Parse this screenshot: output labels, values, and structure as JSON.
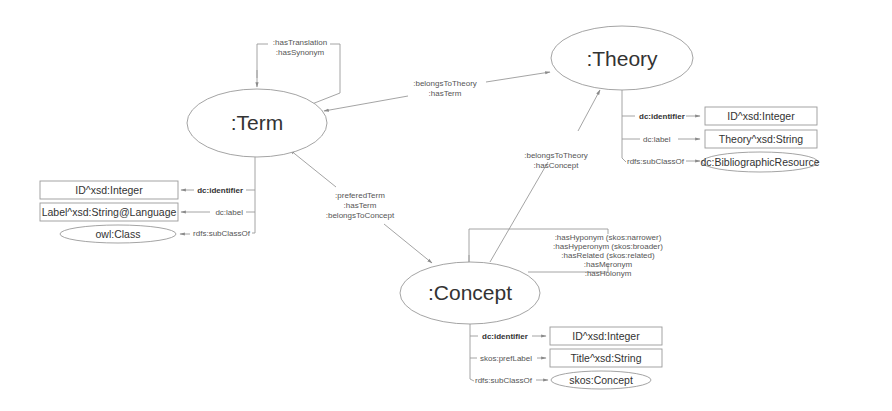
{
  "nodes": {
    "term": {
      "label": ":Term"
    },
    "theory": {
      "label": ":Theory"
    },
    "concept": {
      "label": ":Concept"
    }
  },
  "edges": {
    "term_self": {
      "lines": [
        ":hasTranslation",
        ":hasSynonym"
      ]
    },
    "term_theory": {
      "lines": [
        ":belongsToTheory",
        ":hasTerm"
      ]
    },
    "term_concept": {
      "lines": [
        ":preferedTerm",
        ":hasTerm",
        ":belongsToConcept"
      ]
    },
    "concept_theory": {
      "lines": [
        ":belongsToTheory",
        ":hasConcept"
      ]
    },
    "concept_self": {
      "lines": [
        ":hasHyponym (skos:narrower)",
        ":hasHyperonym (skos:broader)",
        ":hasRelated (skos:related)",
        ":hasMeronym",
        ":hasHolonym"
      ]
    }
  },
  "term_props": [
    {
      "property": "dc:identifier",
      "bold": true,
      "target": "ID^xsd:Integer",
      "target_shape": "rect"
    },
    {
      "property": "dc:label",
      "bold": false,
      "target": "Label^xsd:String@Language",
      "target_shape": "rect"
    },
    {
      "property": "rdfs:subClassOf",
      "bold": false,
      "target": "owl:Class",
      "target_shape": "ellipse"
    }
  ],
  "theory_props": [
    {
      "property": "dc:identifier",
      "bold": true,
      "target": "ID^xsd:Integer",
      "target_shape": "rect"
    },
    {
      "property": "dc:label",
      "bold": false,
      "target": "Theory^xsd:String",
      "target_shape": "rect"
    },
    {
      "property": "rdfs:subClassOf",
      "bold": false,
      "target": "dc:BibliographicResource",
      "target_shape": "ellipse"
    }
  ],
  "concept_props": [
    {
      "property": "dc:identifier",
      "bold": true,
      "target": "ID^xsd:Integer",
      "target_shape": "rect"
    },
    {
      "property": "skos:prefLabel",
      "bold": false,
      "target": "Title^xsd:String",
      "target_shape": "rect"
    },
    {
      "property": "rdfs:subClassOf",
      "bold": false,
      "target": "skos:Concept",
      "target_shape": "ellipse"
    }
  ]
}
